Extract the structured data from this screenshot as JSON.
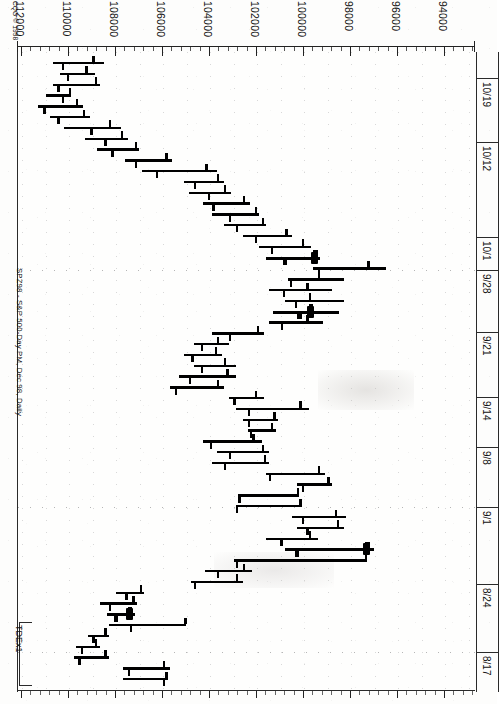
{
  "meta": {
    "copyright": "CQG © 1998",
    "chart_title": "SPZ98 - S&P 500-Day PM, Dec 98, Daily",
    "study_label": "TDEx1"
  },
  "price_axis": {
    "labels": [
      "112000",
      "110000",
      "108000",
      "106000",
      "104000",
      "102000",
      "100000",
      "98000",
      "96000",
      "94000"
    ],
    "values": [
      112000,
      110000,
      108000,
      106000,
      104000,
      102000,
      100000,
      98000,
      96000,
      94000
    ]
  },
  "date_axis": {
    "labels": [
      "10/19",
      "10/12",
      "10/1",
      "9/28",
      "9/21",
      "9/14",
      "9/8",
      "9/1",
      "8/24",
      "8/17"
    ]
  },
  "chart_data": {
    "type": "bar",
    "subtype": "ohlc-bar-chart-rotated-90",
    "title": "SPZ98 - S&P 500-Day PM, Dec 98, Daily",
    "xlabel": "",
    "ylabel": "Price",
    "orientation": "price-horizontal-decreasing-left-to-right",
    "price_axis_labels": [
      "112000",
      "110000",
      "108000",
      "106000",
      "104000",
      "102000",
      "100000",
      "98000",
      "96000",
      "94000"
    ],
    "price_axis_range": [
      113000,
      93000
    ],
    "date_axis_labels": [
      "8/17",
      "8/24",
      "9/1",
      "9/8",
      "9/14",
      "9/21",
      "9/28",
      "10/1",
      "10/12",
      "10/19"
    ],
    "grid": "dotted",
    "legend": "none",
    "series_name": "SPZ98 Daily OHLC",
    "bars": [
      {
        "i": 0,
        "high": 110700,
        "low": 108500,
        "open": 110300,
        "close": 109000,
        "marker": "none"
      },
      {
        "i": 1,
        "high": 110400,
        "low": 108900,
        "open": 110100,
        "close": 109300,
        "marker": "none"
      },
      {
        "i": 2,
        "high": 110700,
        "low": 108700,
        "open": 110500,
        "close": 108900,
        "marker": "none"
      },
      {
        "i": 3,
        "high": 111000,
        "low": 109900,
        "open": 110300,
        "close": 110000,
        "marker": "none"
      },
      {
        "i": 4,
        "high": 111300,
        "low": 109400,
        "open": 111100,
        "close": 109700,
        "marker": "none"
      },
      {
        "i": 5,
        "high": 110800,
        "low": 109100,
        "open": 110500,
        "close": 109400,
        "marker": "none"
      },
      {
        "i": 6,
        "high": 110200,
        "low": 107800,
        "open": 109100,
        "close": 108300,
        "marker": "none"
      },
      {
        "i": 7,
        "high": 109300,
        "low": 107500,
        "open": 108500,
        "close": 107800,
        "marker": "none"
      },
      {
        "i": 8,
        "high": 108800,
        "low": 107000,
        "open": 108200,
        "close": 107200,
        "marker": "none"
      },
      {
        "i": 9,
        "high": 107600,
        "low": 105600,
        "open": 107200,
        "close": 105900,
        "marker": "none"
      },
      {
        "i": 10,
        "high": 106900,
        "low": 103700,
        "open": 106300,
        "close": 104200,
        "marker": "none"
      },
      {
        "i": 11,
        "high": 105100,
        "low": 103400,
        "open": 104700,
        "close": 103700,
        "marker": "none"
      },
      {
        "i": 12,
        "high": 104900,
        "low": 103100,
        "open": 104100,
        "close": 103400,
        "marker": "none"
      },
      {
        "i": 13,
        "high": 104300,
        "low": 102300,
        "open": 103900,
        "close": 102600,
        "marker": "none"
      },
      {
        "i": 14,
        "high": 103900,
        "low": 101900,
        "open": 103200,
        "close": 102100,
        "marker": "none"
      },
      {
        "i": 15,
        "high": 103400,
        "low": 101600,
        "open": 102900,
        "close": 101800,
        "marker": "none"
      },
      {
        "i": 16,
        "high": 102600,
        "low": 100500,
        "open": 102100,
        "close": 100800,
        "marker": "none"
      },
      {
        "i": 17,
        "high": 101900,
        "low": 99700,
        "open": 101400,
        "close": 100100,
        "marker": "none"
      },
      {
        "i": 18,
        "high": 101600,
        "low": 99300,
        "open": 100900,
        "close": 99600,
        "marker": "blob"
      },
      {
        "i": 19,
        "high": 99600,
        "low": 96500,
        "open": 99400,
        "close": 97300,
        "marker": "none"
      },
      {
        "i": 20,
        "high": 100700,
        "low": 98300,
        "open": 100600,
        "close": 99400,
        "marker": "none"
      },
      {
        "i": 21,
        "high": 101500,
        "low": 98800,
        "open": 100900,
        "close": 99900,
        "marker": "none"
      },
      {
        "i": 22,
        "high": 100800,
        "low": 98300,
        "open": 100400,
        "close": 99800,
        "marker": "none"
      },
      {
        "i": 23,
        "high": 101300,
        "low": 98500,
        "open": 100300,
        "close": 99800,
        "marker": "blob"
      },
      {
        "i": 24,
        "high": 101500,
        "low": 99200,
        "open": 101000,
        "close": 99900,
        "marker": "none"
      },
      {
        "i": 25,
        "high": 103900,
        "low": 101700,
        "open": 103200,
        "close": 102000,
        "marker": "none"
      },
      {
        "i": 26,
        "high": 104700,
        "low": 103200,
        "open": 104400,
        "close": 103700,
        "marker": "none"
      },
      {
        "i": 27,
        "high": 105100,
        "low": 103500,
        "open": 104800,
        "close": 103800,
        "marker": "none"
      },
      {
        "i": 28,
        "high": 104700,
        "low": 102900,
        "open": 104400,
        "close": 103400,
        "marker": "none"
      },
      {
        "i": 29,
        "high": 105300,
        "low": 102900,
        "open": 104900,
        "close": 103300,
        "marker": "none"
      },
      {
        "i": 30,
        "high": 105700,
        "low": 103400,
        "open": 105500,
        "close": 103700,
        "marker": "none"
      },
      {
        "i": 31,
        "high": 103200,
        "low": 101700,
        "open": 103000,
        "close": 102100,
        "marker": "none"
      },
      {
        "i": 32,
        "high": 102900,
        "low": 99800,
        "open": 102400,
        "close": 100200,
        "marker": "none"
      },
      {
        "i": 33,
        "high": 102600,
        "low": 101100,
        "open": 102400,
        "close": 101300,
        "marker": "none"
      },
      {
        "i": 34,
        "high": 102400,
        "low": 101200,
        "open": 102300,
        "close": 101400,
        "marker": "none"
      },
      {
        "i": 35,
        "high": 104300,
        "low": 101800,
        "open": 104000,
        "close": 102200,
        "marker": "none"
      },
      {
        "i": 36,
        "high": 103700,
        "low": 101500,
        "open": 103200,
        "close": 101800,
        "marker": "none"
      },
      {
        "i": 37,
        "high": 103900,
        "low": 101500,
        "open": 103400,
        "close": 101700,
        "marker": "none"
      },
      {
        "i": 38,
        "high": 101600,
        "low": 99100,
        "open": 101500,
        "close": 99400,
        "marker": "none"
      },
      {
        "i": 39,
        "high": 100300,
        "low": 98800,
        "open": 100100,
        "close": 99000,
        "marker": "none"
      },
      {
        "i": 40,
        "high": 102800,
        "low": 100200,
        "open": 102800,
        "close": 100300,
        "marker": "none"
      },
      {
        "i": 41,
        "high": 102900,
        "low": 100100,
        "open": 102900,
        "close": 100200,
        "marker": "none"
      },
      {
        "i": 42,
        "high": 100500,
        "low": 98200,
        "open": 100100,
        "close": 98700,
        "marker": "none"
      },
      {
        "i": 43,
        "high": 100300,
        "low": 98300,
        "open": 99900,
        "close": 98600,
        "marker": "none"
      },
      {
        "i": 44,
        "high": 101600,
        "low": 99400,
        "open": 101000,
        "close": 99800,
        "marker": "none"
      },
      {
        "i": 45,
        "high": 100800,
        "low": 97000,
        "open": 100400,
        "close": 97400,
        "marker": "blob"
      },
      {
        "i": 46,
        "high": 103000,
        "low": 97300,
        "open": 102900,
        "close": 97400,
        "marker": "none"
      },
      {
        "i": 47,
        "high": 104200,
        "low": 102200,
        "open": 103700,
        "close": 102600,
        "marker": "none"
      },
      {
        "i": 48,
        "high": 104800,
        "low": 102600,
        "open": 104700,
        "close": 102900,
        "marker": "none"
      },
      {
        "i": 49,
        "high": 108000,
        "low": 106800,
        "open": 107600,
        "close": 107000,
        "marker": "none"
      },
      {
        "i": 50,
        "high": 108700,
        "low": 107100,
        "open": 108300,
        "close": 107300,
        "marker": "none"
      },
      {
        "i": 51,
        "high": 108400,
        "low": 107200,
        "open": 108100,
        "close": 107500,
        "marker": "blob"
      },
      {
        "i": 52,
        "high": 108300,
        "low": 105000,
        "open": 107400,
        "close": 105100,
        "marker": "none"
      },
      {
        "i": 53,
        "high": 109200,
        "low": 108300,
        "open": 109000,
        "close": 108500,
        "marker": "none"
      },
      {
        "i": 54,
        "high": 109700,
        "low": 108700,
        "open": 109500,
        "close": 108900,
        "marker": "none"
      },
      {
        "i": 55,
        "high": 109800,
        "low": 108300,
        "open": 109600,
        "close": 108500,
        "marker": "none"
      },
      {
        "i": 56,
        "high": 107700,
        "low": 105700,
        "open": 107500,
        "close": 106000,
        "marker": "none"
      },
      {
        "i": 57,
        "high": 107700,
        "low": 105800,
        "open": 106000,
        "close": 105900,
        "marker": "none"
      }
    ]
  }
}
